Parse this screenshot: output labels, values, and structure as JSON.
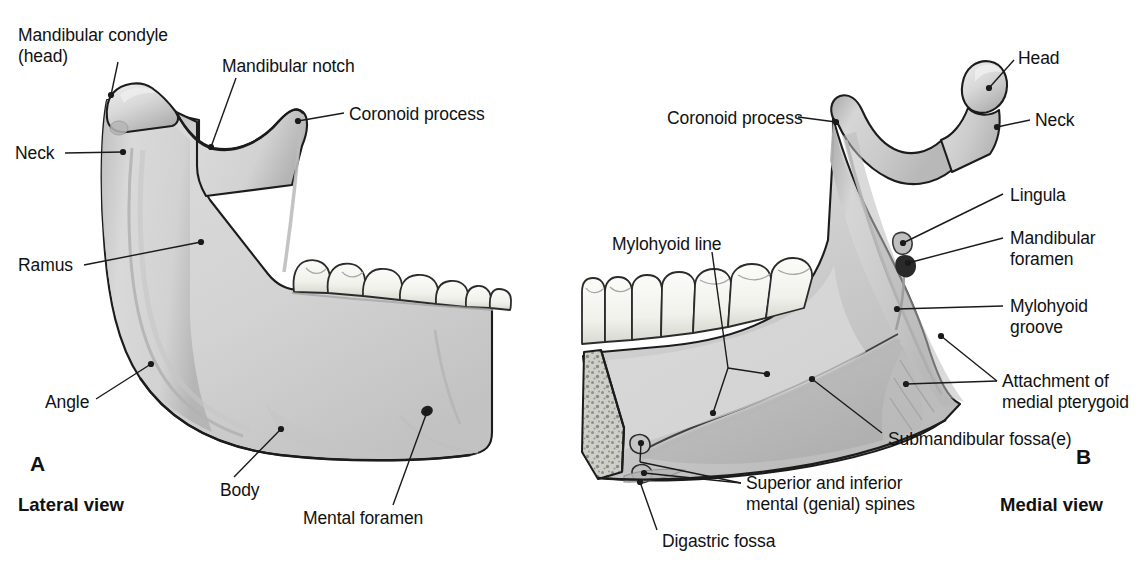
{
  "figure": {
    "background_color": "#ffffff",
    "bone_fill_color": "#d4d4d4",
    "bone_shadow_color": "#a8a8a8",
    "tooth_fill_color": "#f7f7f4",
    "outline_color": "#1a1a1a",
    "leader_color": "#1a1a1a"
  },
  "panels": [
    {
      "letter": "A",
      "view_label": "Lateral view",
      "letter_pos": {
        "x": 30,
        "y": 462
      },
      "view_pos": {
        "x": 18,
        "y": 500
      }
    },
    {
      "letter": "B",
      "view_label": "Medial view",
      "letter_pos": {
        "x": 1076,
        "y": 455
      },
      "view_pos": {
        "x": 1000,
        "y": 500
      }
    }
  ],
  "labels_lateral": [
    {
      "id": "mandibular-condyle-head",
      "lines": [
        "Mandibular condyle",
        "(head)"
      ],
      "text_pos": {
        "x": 18,
        "y": 25
      },
      "align": "left",
      "leaders": [
        {
          "from": [
            118,
            62
          ],
          "to": [
            111,
            95
          ]
        }
      ],
      "dots": [
        [
          111,
          95
        ]
      ]
    },
    {
      "id": "mandibular-notch",
      "lines": [
        "Mandibular notch"
      ],
      "text_pos": {
        "x": 222,
        "y": 56
      },
      "align": "left",
      "leaders": [
        {
          "from": [
            236,
            78
          ],
          "to": [
            211,
            147
          ]
        }
      ],
      "dots": [
        [
          211,
          147
        ]
      ]
    },
    {
      "id": "coronoid-process",
      "lines": [
        "Coronoid process"
      ],
      "text_pos": {
        "x": 349,
        "y": 104
      },
      "align": "left",
      "leaders": [
        {
          "from": [
            344,
            113
          ],
          "to": [
            298,
            121
          ]
        }
      ],
      "dots": [
        [
          298,
          121
        ]
      ]
    },
    {
      "id": "neck",
      "lines": [
        "Neck"
      ],
      "text_pos": {
        "x": 15,
        "y": 143
      },
      "align": "left",
      "leaders": [
        {
          "from": [
            65,
            153
          ],
          "to": [
            123,
            152
          ]
        }
      ],
      "dots": [
        [
          123,
          152
        ]
      ]
    },
    {
      "id": "ramus",
      "lines": [
        "Ramus"
      ],
      "text_pos": {
        "x": 18,
        "y": 255
      },
      "align": "left",
      "leaders": [
        {
          "from": [
            84,
            265
          ],
          "to": [
            201,
            242
          ]
        }
      ],
      "dots": [
        [
          201,
          242
        ]
      ]
    },
    {
      "id": "angle",
      "lines": [
        "Angle"
      ],
      "text_pos": {
        "x": 45,
        "y": 392
      },
      "align": "left",
      "leaders": [
        {
          "from": [
            96,
            399
          ],
          "to": [
            151,
            364
          ]
        }
      ],
      "dots": [
        [
          151,
          364
        ]
      ]
    },
    {
      "id": "body",
      "lines": [
        "Body"
      ],
      "text_pos": {
        "x": 220,
        "y": 480
      },
      "align": "left",
      "leaders": [
        {
          "from": [
            234,
            477
          ],
          "to": [
            281,
            429
          ]
        }
      ],
      "dots": [
        [
          281,
          429
        ]
      ]
    },
    {
      "id": "mental-foramen",
      "lines": [
        "Mental foramen"
      ],
      "text_pos": {
        "x": 303,
        "y": 508
      },
      "align": "left",
      "leaders": [
        {
          "from": [
            393,
            505
          ],
          "to": [
            427,
            412
          ]
        }
      ],
      "dots": [
        [
          427,
          412
        ]
      ]
    }
  ],
  "labels_medial": [
    {
      "id": "head",
      "lines": [
        "Head"
      ],
      "text_pos": {
        "x": 1018,
        "y": 48
      },
      "align": "left",
      "leaders": [
        {
          "from": [
            1014,
            60
          ],
          "to": [
            989,
            88
          ]
        }
      ],
      "dots": [
        [
          989,
          88
        ]
      ]
    },
    {
      "id": "neck",
      "lines": [
        "Neck"
      ],
      "text_pos": {
        "x": 1035,
        "y": 110
      },
      "align": "left",
      "leaders": [
        {
          "from": [
            1030,
            120
          ],
          "to": [
            997,
            127
          ]
        }
      ],
      "dots": [
        [
          997,
          127
        ]
      ]
    },
    {
      "id": "coronoid-process",
      "lines": [
        "Coronoid process"
      ],
      "text_pos": {
        "x": 667,
        "y": 108
      },
      "align": "left",
      "leaders": [
        {
          "from": [
            798,
            117
          ],
          "to": [
            836,
            122
          ]
        }
      ],
      "dots": [
        [
          836,
          122
        ]
      ]
    },
    {
      "id": "lingula",
      "lines": [
        "Lingula"
      ],
      "text_pos": {
        "x": 1010,
        "y": 185
      },
      "align": "left",
      "leaders": [
        {
          "from": [
            1003,
            194
          ],
          "to": [
            903,
            243
          ]
        }
      ],
      "dots": [
        [
          903,
          243
        ]
      ]
    },
    {
      "id": "mandibular-foramen",
      "lines": [
        "Mandibular",
        "foramen"
      ],
      "text_pos": {
        "x": 1010,
        "y": 228
      },
      "align": "left",
      "leaders": [
        {
          "from": [
            1003,
            238
          ],
          "to": [
            908,
            263
          ]
        }
      ],
      "dots": [
        [
          908,
          263
        ]
      ]
    },
    {
      "id": "mylohyoid-groove",
      "lines": [
        "Mylohyoid",
        "groove"
      ],
      "text_pos": {
        "x": 1010,
        "y": 296
      },
      "align": "left",
      "leaders": [
        {
          "from": [
            1003,
            306
          ],
          "to": [
            897,
            309
          ]
        }
      ],
      "dots": [
        [
          897,
          309
        ]
      ]
    },
    {
      "id": "attachment-medial-pterygoid",
      "lines": [
        "Attachment of",
        "medial pterygoid"
      ],
      "text_pos": {
        "x": 1002,
        "y": 371
      },
      "align": "left",
      "leaders": [
        {
          "from": [
            997,
            381
          ],
          "to": [
            941,
            336
          ]
        },
        {
          "from": [
            997,
            381
          ],
          "to": [
            906,
            384
          ]
        }
      ],
      "dots": [
        [
          941,
          336
        ],
        [
          906,
          384
        ]
      ]
    },
    {
      "id": "submandibular-fossae",
      "lines": [
        "Submandibular fossa(e)"
      ],
      "text_pos": {
        "x": 888,
        "y": 429
      },
      "align": "left",
      "leaders": [
        {
          "from": [
            882,
            433
          ],
          "to": [
            812,
            379
          ]
        }
      ],
      "dots": [
        [
          812,
          379
        ]
      ]
    },
    {
      "id": "mylohyoid-line",
      "lines": [
        "Mylohyoid line"
      ],
      "text_pos": {
        "x": 612,
        "y": 234
      },
      "align": "left",
      "leaders": [
        {
          "from": [
            712,
            252
          ],
          "to": [
            728,
            368
          ]
        },
        {
          "from": [
            728,
            368
          ],
          "to": [
            767,
            374
          ]
        },
        {
          "from": [
            728,
            368
          ],
          "to": [
            713,
            413
          ]
        }
      ],
      "dots": [
        [
          767,
          374
        ],
        [
          713,
          413
        ]
      ]
    },
    {
      "id": "superior-inferior-mental-genial-spines",
      "lines": [
        "Superior and inferior",
        "mental (genial) spines"
      ],
      "text_pos": {
        "x": 746,
        "y": 473
      },
      "align": "left",
      "leaders": [
        {
          "from": [
            741,
            483
          ],
          "to": [
            640,
            462
          ]
        },
        {
          "from": [
            640,
            462
          ],
          "to": [
            641,
            443
          ]
        },
        {
          "from": [
            741,
            483
          ],
          "to": [
            644,
            473
          ]
        }
      ],
      "dots": [
        [
          641,
          443
        ],
        [
          644,
          473
        ]
      ]
    },
    {
      "id": "digastric-fossa",
      "lines": [
        "Digastric fossa"
      ],
      "text_pos": {
        "x": 662,
        "y": 531
      },
      "align": "left",
      "leaders": [
        {
          "from": [
            657,
            530
          ],
          "to": [
            640,
            482
          ]
        }
      ],
      "dots": [
        [
          640,
          482
        ]
      ]
    }
  ]
}
